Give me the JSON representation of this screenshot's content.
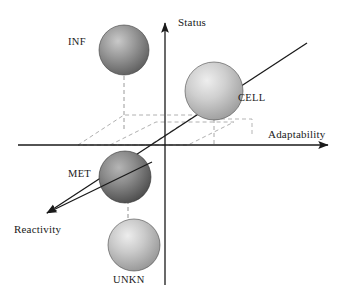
{
  "figure": {
    "type": "3d-scatter-schematic",
    "background": "#ffffff"
  },
  "axes": [
    {
      "id": "status",
      "label": "Status",
      "orientation": "vertical-up",
      "color": "#1a1a1a",
      "from": [
        165,
        285
      ],
      "to": [
        165,
        20
      ],
      "arrow": true
    },
    {
      "id": "adaptability",
      "label": "Adaptability",
      "orientation": "horizontal-right",
      "color": "#1a1a1a",
      "from": [
        18,
        145
      ],
      "to": [
        331,
        145
      ],
      "arrow": true
    },
    {
      "id": "reactivity",
      "label": "Reactivity",
      "orientation": "diagonal-down-left",
      "color": "#1a1a1a",
      "from": [
        307,
        43
      ],
      "to": [
        43,
        216
      ],
      "arrow": true
    }
  ],
  "origin": [
    165,
    145
  ],
  "spheres": [
    {
      "id": "inf",
      "label": "INF",
      "cx": 124,
      "cy": 50,
      "r": 25,
      "fill_light": "#c9c9c9",
      "fill_mid": "#9a9a9a",
      "fill_dark": "#5e5e5e",
      "tone": "medium-dark",
      "label_position": "left"
    },
    {
      "id": "cell",
      "label": "CELL",
      "cx": 214,
      "cy": 91,
      "r": 29,
      "fill_light": "#e8e8e8",
      "fill_mid": "#cfcfcf",
      "fill_dark": "#9d9d9d",
      "tone": "light",
      "label_position": "right"
    },
    {
      "id": "met",
      "label": "MET",
      "cx": 125,
      "cy": 177,
      "r": 26,
      "fill_light": "#b5b5b5",
      "fill_mid": "#8a8a8a",
      "fill_dark": "#4c4c4c",
      "tone": "dark",
      "label_position": "left"
    },
    {
      "id": "unkn",
      "label": "UNKN",
      "cx": 134,
      "cy": 245,
      "r": 26,
      "fill_light": "#e6e6e6",
      "fill_mid": "#cacaca",
      "fill_dark": "#969696",
      "tone": "light",
      "label_position": "below"
    }
  ],
  "projection_lines": [
    {
      "id": "inf-drop",
      "from": [
        124,
        76
      ],
      "to": [
        124,
        128
      ],
      "style": "dashed",
      "color": "#9a9a9a"
    },
    {
      "id": "met-drop",
      "from": [
        128,
        200
      ],
      "to": [
        128,
        222
      ],
      "style": "dashed",
      "color": "#8f8f8f"
    },
    {
      "id": "cell-drop",
      "from": [
        214,
        119
      ],
      "to": [
        214,
        145
      ],
      "style": "dashed",
      "color": "#a8a8a8"
    }
  ],
  "projection_planes": [
    {
      "id": "left-parallelogram",
      "points": "78,145 124,115 196,115 150,145",
      "style": "dashed",
      "color": "#b0b0b0"
    },
    {
      "id": "right-parallelogram",
      "points": "110,145 156,122 234,122 188,145",
      "style": "dashed",
      "color": "#b0b0b0"
    },
    {
      "id": "cell-plane",
      "points": "165,145 214,119 252,119 203,145",
      "style": "dashed",
      "color": "#b5b5b5"
    }
  ]
}
